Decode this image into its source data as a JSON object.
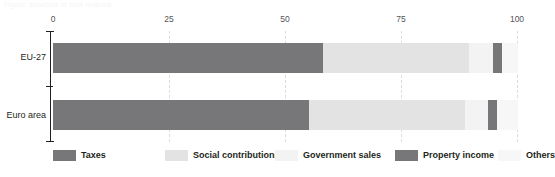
{
  "caption": {
    "text": "Figure: structure of total revenue"
  },
  "chart_data": {
    "type": "bar",
    "orientation": "horizontal",
    "stacked": true,
    "normalized": true,
    "title": "",
    "xlabel": "",
    "ylabel": "",
    "xlim": [
      0,
      100
    ],
    "xticks": [
      0,
      25,
      50,
      75,
      100
    ],
    "xtick_labels": [
      "0",
      "25",
      "50",
      "75",
      "100"
    ],
    "grid": true,
    "legend_position": "bottom",
    "categories": [
      "EU-27",
      "Euro area"
    ],
    "series": [
      {
        "name": "Taxes",
        "color": "#77777a",
        "values": [
          58.0,
          55.0
        ]
      },
      {
        "name": "Social contributions",
        "color": "#e3e3e3",
        "values": [
          31.5,
          33.5
        ]
      },
      {
        "name": "Government sales",
        "color": "#f3f3f3",
        "values": [
          5.2,
          5.0
        ]
      },
      {
        "name": "Property income",
        "color": "#77777a",
        "values": [
          1.9,
          2.0
        ]
      },
      {
        "name": "Others",
        "color": "#f7f7f7",
        "values": [
          3.4,
          4.5
        ]
      }
    ]
  },
  "axis": {
    "ticks": [
      {
        "label": "0",
        "value": 0
      },
      {
        "label": "25",
        "value": 25
      },
      {
        "label": "50",
        "value": 50
      },
      {
        "label": "75",
        "value": 75
      },
      {
        "label": "100",
        "value": 100
      }
    ],
    "categories": [
      {
        "label": "EU-27"
      },
      {
        "label": "Euro area"
      }
    ]
  },
  "legend": {
    "items": [
      {
        "label": "Taxes",
        "color": "#77777a",
        "x": 0,
        "swatch": true
      },
      {
        "label": "Social contributions",
        "color": "#e3e3e3",
        "x": 112,
        "swatch": true
      },
      {
        "label": "Government sales",
        "color": "#f3f3f3",
        "x": 222,
        "swatch": true
      },
      {
        "label": "Property income",
        "color": "#77777a",
        "x": 342,
        "swatch": true
      },
      {
        "label": "Others",
        "color": "#f7f7f7",
        "x": 445,
        "swatch": true
      }
    ]
  }
}
